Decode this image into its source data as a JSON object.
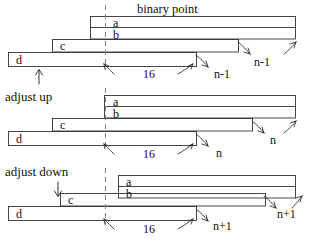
{
  "figure": {
    "title": "binary point",
    "background_color": "#ffffff",
    "line_color": "#333333",
    "dashed_line_color": "#808080",
    "text_color": "#111111"
  },
  "annotations": {
    "adjust_up": "adjust up",
    "adjust_down": "adjust down",
    "up_arrow_icon": "up-arrow-icon",
    "down_arrow_icon": "down-arrow-icon",
    "binary_point_icon": "dashed-vertical-line-icon"
  },
  "groups": [
    {
      "name": "top-group",
      "rows": [
        {
          "label": "a"
        },
        {
          "label": "b"
        },
        {
          "label": "c"
        },
        {
          "label": "d"
        }
      ],
      "measures": [
        {
          "label": "16",
          "name": "fraction-width-label"
        },
        {
          "label": "n-1",
          "name": "shift-label-lower"
        },
        {
          "label": "n-1",
          "name": "shift-label-upper"
        }
      ]
    },
    {
      "name": "middle-group",
      "rows": [
        {
          "label": "a"
        },
        {
          "label": "b"
        },
        {
          "label": "c"
        },
        {
          "label": "d"
        }
      ],
      "measures": [
        {
          "label": "16",
          "name": "fraction-width-label"
        },
        {
          "label": "n",
          "name": "shift-label-lower"
        },
        {
          "label": "n",
          "name": "shift-label-upper"
        }
      ]
    },
    {
      "name": "bottom-group",
      "rows": [
        {
          "label": "a"
        },
        {
          "label": "b"
        },
        {
          "label": "c"
        },
        {
          "label": "d"
        }
      ],
      "measures": [
        {
          "label": "16",
          "name": "fraction-width-label"
        },
        {
          "label": "n+1",
          "name": "shift-label-lower"
        },
        {
          "label": "n+1",
          "name": "shift-label-upper"
        }
      ]
    }
  ]
}
